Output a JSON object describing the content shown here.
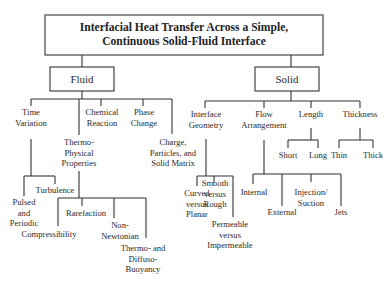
{
  "diagram": {
    "title_line1": "Interfacial Heat Transfer Across a Simple,",
    "title_line2": "Continuous Solid-Fluid Interface",
    "fluid": {
      "label": "Fluid",
      "time_variation": {
        "line1": "Time",
        "line2": "Variation",
        "pulsed": {
          "line1": "Pulsed",
          "line2": "and",
          "line3": "Periodic"
        },
        "turbulence": "Turbulence"
      },
      "thermo_physical": {
        "line1": "Thermo-",
        "line2": "Physical",
        "line3": "Properties",
        "compressibility": "Compressibility",
        "rarefaction": "Rarefaction",
        "non_newtonian": {
          "line1": "Non-",
          "line2": "Newtonian"
        },
        "buoyancy": {
          "line1": "Thermo- and",
          "line2": "Diffuso-",
          "line3": "Buoyancy"
        }
      },
      "chemical_reaction": {
        "line1": "Chemical",
        "line2": "Reaction"
      },
      "phase_change": {
        "line1": "Phase",
        "line2": "Change"
      },
      "charge": {
        "line1": "Charge,",
        "line2": "Particles, and",
        "line3": "Solid Matrix"
      }
    },
    "solid": {
      "label": "Solid",
      "interface_geometry": {
        "line1": "Interface",
        "line2": "Geometry",
        "curved": {
          "line1": "Curved",
          "line2": "versus",
          "line3": "Planar"
        },
        "smooth": {
          "line1": "Smooth",
          "line2": "versus",
          "line3": "Rough"
        },
        "permeable": {
          "line1": "Permeable",
          "line2": "versus",
          "line3": "Impermeable"
        }
      },
      "flow_arrangement": {
        "line1": "Flow",
        "line2": "Arrangement",
        "internal": "Internal",
        "external": "External",
        "injection": {
          "line1": "Injection/",
          "line2": "Suction"
        },
        "jets": "Jets"
      },
      "length": {
        "label": "Length",
        "short": "Short",
        "long": "Long"
      },
      "thickness": {
        "label": "Thickness",
        "thin": "Thin",
        "thick": "Thick"
      }
    }
  }
}
